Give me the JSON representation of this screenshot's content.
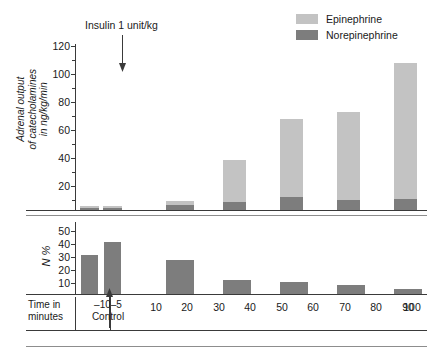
{
  "legend": {
    "items": [
      {
        "label": "Epinephrine",
        "color": "#c3c3c3",
        "key": "epinephrine"
      },
      {
        "label": "Norepinephrine",
        "color": "#7d7d7d",
        "key": "norepinephrine"
      }
    ]
  },
  "annotation": {
    "insulin_label": "Insulin 1 unit/kg",
    "arrow_icon": "down-arrow-icon"
  },
  "axes": {
    "top_ylabel_line1": "Adrenal output",
    "top_ylabel_line2": "of catecholamines",
    "top_ylabel_line3": "in ng/kg/min",
    "top_yticks": [
      "120",
      "100",
      "80",
      "60",
      "40",
      "20"
    ],
    "bottom_ylabel": "N %",
    "bottom_yticks": [
      "50",
      "40",
      "30",
      "20",
      "10"
    ],
    "time_caption_line1": "Time in",
    "time_caption_line2": "minutes",
    "control_label": "Control",
    "control_ticks": [
      "–10",
      "–5"
    ],
    "xticks": [
      "10",
      "20",
      "30",
      "40",
      "50",
      "60",
      "70",
      "80",
      "90",
      "100"
    ]
  },
  "chart_data": {
    "type": "bar",
    "title": "",
    "subtitle": "",
    "panels": [
      {
        "name": "adrenal-output-panel",
        "ylabel": "Adrenal output of catecholamines in ng/kg/min",
        "xlabel": "Time in minutes",
        "ylim": [
          0,
          120
        ],
        "ytick_values": [
          20,
          40,
          60,
          80,
          100,
          120
        ],
        "ytick_minor": [
          10,
          30,
          50,
          70,
          90,
          110
        ],
        "grid": false,
        "stacked": true,
        "categories": [
          "-10",
          "-5",
          "10",
          "20",
          "30",
          "40",
          "50",
          "60",
          "70",
          "80",
          "90",
          "100"
        ],
        "series": [
          {
            "name": "Norepinephrine",
            "color": "#7d7d7d",
            "values": [
              1.5,
              1.5,
              0,
              3.5,
              0,
              5.5,
              0,
              9.5,
              0,
              7.5,
              0,
              8.0
            ]
          },
          {
            "name": "Epinephrine",
            "color": "#c3c3c3",
            "values": [
              1.5,
              1.5,
              0,
              3.0,
              0,
              30.5,
              0,
              56.5,
              0,
              63.5,
              0,
              98.0
            ]
          }
        ],
        "totals": [
          3,
          3,
          0,
          6.5,
          0,
          36,
          0,
          66,
          0,
          71,
          0,
          106
        ]
      },
      {
        "name": "n-percent-panel",
        "ylabel": "N %",
        "xlabel": "Time in minutes",
        "ylim": [
          0,
          55
        ],
        "ytick_values": [
          10,
          20,
          30,
          40,
          50
        ],
        "grid": false,
        "stacked": false,
        "categories": [
          "-10",
          "-5",
          "10",
          "20",
          "30",
          "40",
          "50",
          "60",
          "70",
          "80",
          "90",
          "100"
        ],
        "series": [
          {
            "name": "N %",
            "color": "#7d7d7d",
            "values": [
              30,
              40,
              0,
              26,
              0,
              10.5,
              0,
              9,
              0,
              7,
              0,
              4
            ]
          }
        ]
      }
    ],
    "legend": [
      "Epinephrine",
      "Norepinephrine"
    ],
    "legend_position": "top-right",
    "annotations": [
      {
        "text": "Insulin 1 unit/kg",
        "x": "0",
        "type": "arrow-down"
      }
    ]
  },
  "colors": {
    "epinephrine": "#c3c3c3",
    "norepinephrine": "#7d7d7d",
    "axis": "#3a3a3a",
    "rule": "#8d8d8d"
  }
}
